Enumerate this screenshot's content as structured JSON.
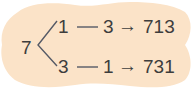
{
  "diagram": {
    "type": "tree",
    "root": {
      "label": "7"
    },
    "branches": [
      {
        "first": "1",
        "connector": "—",
        "second": "3",
        "arrow": "→",
        "result": "713"
      },
      {
        "first": "3",
        "connector": "—",
        "second": "1",
        "arrow": "→",
        "result": "731"
      }
    ],
    "colors": {
      "background_blob": "#fbe3c8",
      "text": "#3d3d3d",
      "lines": "#555a66"
    }
  }
}
